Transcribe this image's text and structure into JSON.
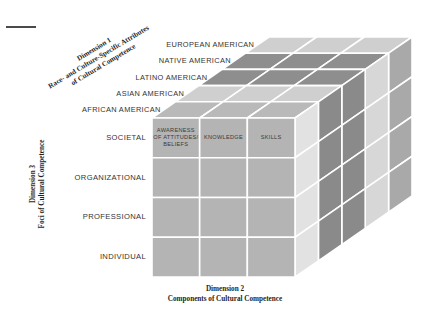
{
  "figure": {
    "kind": "3d-cube-model",
    "title_rule": true
  },
  "dimension1": {
    "title_line1": "Dimension 1",
    "title_line2": "Race- and Culture-Specific Attributes",
    "title_line3": "of Cultural Competence",
    "categories": [
      "EUROPEAN AMERICAN",
      "NATIVE AMERICAN",
      "LATINO AMERICAN",
      "ASIAN AMERICAN",
      "AFRICAN AMERICAN"
    ]
  },
  "dimension2": {
    "title_line1": "Dimension 2",
    "title_line2": "Components of Cultural Competence",
    "columns": [
      "AWARENESS\nOF ATTITUDES/\nBELIEFS",
      "KNOWLEDGE",
      "SKILLS"
    ]
  },
  "dimension3": {
    "title_line1": "Dimension 3",
    "title_line2": "Foci of Cultural Competence",
    "levels": [
      "SOCIETAL",
      "ORGANIZATIONAL",
      "PROFESSIONAL",
      "INDIVIDUAL"
    ]
  },
  "colors": {
    "front_face": "#b4b4b4",
    "top_light": "#cfcfcf",
    "top_dark": "#8e8e8e",
    "top_medium": "#b9b9b9",
    "side_medium": "#a9a9a9",
    "side_light": "#d7d7d7",
    "side_dark": "#8a8a8a",
    "side_pale": "#e2e2e2",
    "gridline": "#ffffff",
    "text": "#2b2b2b",
    "rule": "#4a4a4a"
  },
  "geometry": {
    "front_left_x": 152,
    "front_right_x": 295,
    "front_top_y": 118,
    "front_bottom_y": 277,
    "depth_dx": 117,
    "depth_dy": -81,
    "front_cols": 3,
    "front_rows": 4,
    "depth_slices": 5
  }
}
